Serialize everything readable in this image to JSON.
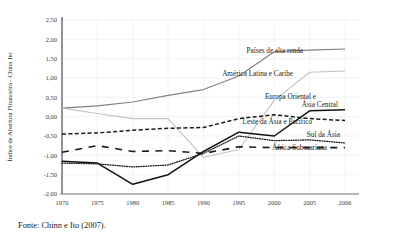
{
  "source_note": "Fonte: Chinn e Ito (2007).",
  "chart_data": {
    "type": "line",
    "title": "",
    "xlabel": "",
    "ylabel": "Índice de Abertura Financeira - Chinn Ito",
    "categories": [
      "1970",
      "1975",
      "1980",
      "1985",
      "1990",
      "1995",
      "2000",
      "2005",
      "2006"
    ],
    "ylim": [
      -2.0,
      2.5
    ],
    "yticks": [
      "2,50",
      "2,00",
      "1,50",
      "1,00",
      "0,50",
      "0,00",
      "-0,50",
      "-1,00",
      "-1,50",
      "-2,00"
    ],
    "ytick_values": [
      2.5,
      2.0,
      1.5,
      1.0,
      0.5,
      0.0,
      -0.5,
      -1.0,
      -1.5,
      -2.0
    ],
    "grid": true,
    "legend_position": "right-inline",
    "series": [
      {
        "name": "Países de alta renda",
        "style": "solid",
        "color": "#808080",
        "width": 1.1,
        "values": [
          0.22,
          0.28,
          0.38,
          0.55,
          0.7,
          1.05,
          1.68,
          1.72,
          1.75
        ],
        "label_x": 303,
        "label_y": 53
      },
      {
        "name": "América Latina e Caribe",
        "style": "solid",
        "color": "#c2c2c2",
        "width": 1.1,
        "values": [
          0.22,
          0.08,
          -0.05,
          -0.05,
          -1.05,
          -0.85,
          0.42,
          1.15,
          1.18
        ],
        "label_x": 293,
        "label_y": 76
      },
      {
        "name": "Europa Oriental e Ásia Central",
        "style": "dashed",
        "color": "#1a1a1a",
        "width": 1.5,
        "values": [
          -0.45,
          -0.42,
          -0.35,
          -0.3,
          -0.28,
          -0.05,
          0.05,
          -0.05,
          -0.1
        ],
        "label_x": 316,
        "label_y": 99,
        "label_line2": "Ásia Central",
        "label_y2": 107
      },
      {
        "name": "Leste da Ásia e Pacífico",
        "style": "solid",
        "color": "#111111",
        "width": 1.5,
        "values": [
          -1.15,
          -1.2,
          -1.75,
          -1.5,
          -0.9,
          -0.4,
          -0.5,
          0.15,
          0.18
        ],
        "label_x": 312,
        "label_y": 124
      },
      {
        "name": "Sul da Ásia",
        "style": "dotted",
        "color": "#1a1a1a",
        "width": 1.3,
        "values": [
          -1.2,
          -1.22,
          -1.3,
          -1.25,
          -0.95,
          -0.5,
          -0.62,
          -0.6,
          -0.68
        ],
        "label_x": 340,
        "label_y": 137
      },
      {
        "name": "África Subsaariana",
        "style": "long-dash",
        "color": "#1a1a1a",
        "width": 1.6,
        "values": [
          -0.92,
          -0.75,
          -0.9,
          -0.88,
          -0.95,
          -0.78,
          -0.8,
          -0.8,
          -0.8
        ],
        "label_x": 327,
        "label_y": 150
      }
    ]
  }
}
